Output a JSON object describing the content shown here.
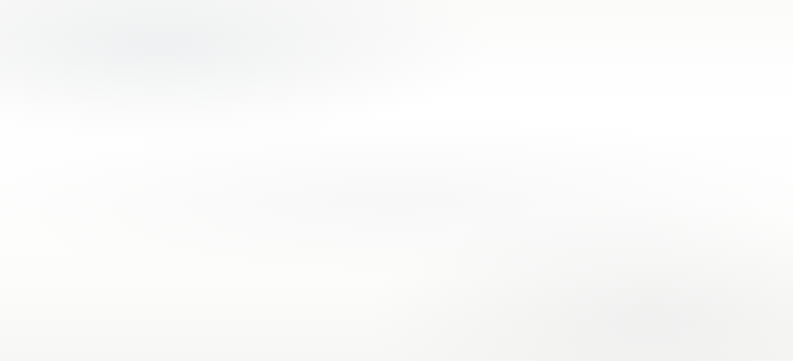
{
  "chart_data": {
    "type": "bar",
    "title": "",
    "subtitle": "",
    "xlabel": "",
    "ylabel": "Percent",
    "ylim": [
      0,
      100
    ],
    "yticks": [
      0,
      20,
      40,
      60,
      80,
      100
    ],
    "ytick_labels": [
      "0",
      "20",
      "40",
      "60",
      "80",
      "100"
    ],
    "minor_ytick_interval": 10,
    "grid": "horizontal",
    "legend_position": "upper-right-inside",
    "categories": [
      "For the meat",
      "To protect humans from harm",
      "To get locally sourced food",
      "For wildlife management",
      "To protect property",
      "For the sport",
      "For the challenge",
      "For a trophy"
    ],
    "category_lines": [
      [
        "For the meat"
      ],
      [
        "To protect",
        "humans from",
        "harm"
      ],
      [
        "To get locally",
        "sourced food"
      ],
      [
        "For wildlife",
        "management"
      ],
      [
        "To protect",
        "property"
      ],
      [
        "For the sport"
      ],
      [
        "For the",
        "challenge"
      ],
      [
        "For a trophy"
      ]
    ],
    "series": [
      {
        "name": "2006",
        "color": "#2c3f72",
        "values": [
          85,
          85,
          null,
          81,
          71,
          53,
          40,
          28
        ],
        "labels": [
          "85",
          "85",
          "*",
          "81",
          "71",
          "53",
          "40",
          "28"
        ]
      },
      {
        "name": "2016",
        "color": "#41703f",
        "values": [
          88,
          87,
          85,
          78,
          69,
          36,
          26,
          21
        ],
        "labels": [
          "88",
          "87",
          "85",
          "78",
          "69",
          "36",
          "26",
          "21"
        ]
      },
      {
        "name": "2019",
        "color": "#cbb2cb",
        "values": [
          84,
          85,
          83,
          82,
          74,
          50,
          41,
          29
        ],
        "labels": [
          "84",
          "85",
          "83",
          "82",
          "74",
          "50",
          "41",
          "29"
        ]
      }
    ],
    "missing_value_marker": "*"
  },
  "legend": {
    "items": [
      {
        "label": "2006",
        "color": "#2c3f72"
      },
      {
        "label": "2016",
        "color": "#41703f"
      },
      {
        "label": "2019",
        "color": "#cbb2cb"
      }
    ]
  },
  "axis": {
    "y_title": "Percent"
  }
}
